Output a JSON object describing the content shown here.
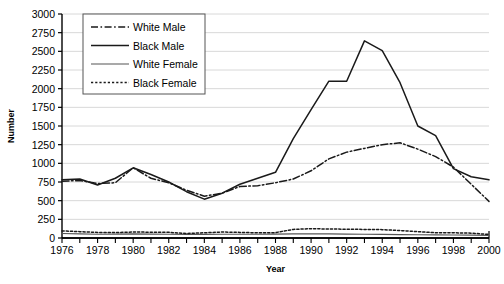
{
  "chart_data": {
    "type": "line",
    "title": "",
    "xlabel": "Year",
    "ylabel": "Number",
    "xlim": [
      1976,
      2000
    ],
    "ylim": [
      0,
      3000
    ],
    "ytick_step": 250,
    "xtick_step": 1,
    "xlabel_step": 2,
    "grid": "horizontal",
    "legend_position": "top-left-inside",
    "x": [
      1976,
      1977,
      1978,
      1979,
      1980,
      1981,
      1982,
      1983,
      1984,
      1985,
      1986,
      1987,
      1988,
      1989,
      1990,
      1991,
      1992,
      1993,
      1994,
      1995,
      1996,
      1997,
      1998,
      1999,
      2000
    ],
    "xticklabels": [
      "1976",
      "",
      "1978",
      "",
      "1980",
      "",
      "1982",
      "",
      "1984",
      "",
      "1986",
      "",
      "1988",
      "",
      "1990",
      "",
      "1992",
      "",
      "1994",
      "",
      "1996",
      "",
      "1998",
      "",
      "2000"
    ],
    "yticklabels": [
      "0",
      "250",
      "500",
      "750",
      "1000",
      "1250",
      "1500",
      "1750",
      "2000",
      "2250",
      "2500",
      "2750",
      "3000"
    ],
    "series": [
      {
        "name": "White Male",
        "linestyle": "dashdot",
        "color": "#1a1a1a",
        "values": [
          760,
          770,
          730,
          740,
          940,
          800,
          740,
          640,
          560,
          600,
          690,
          700,
          740,
          790,
          900,
          1060,
          1150,
          1200,
          1250,
          1275,
          1190,
          1090,
          950,
          720,
          490
        ]
      },
      {
        "name": "Black Male",
        "linestyle": "solid",
        "color": "#1a1a1a",
        "values": [
          780,
          790,
          710,
          800,
          940,
          850,
          750,
          620,
          520,
          600,
          720,
          800,
          880,
          1330,
          1720,
          2100,
          2100,
          2640,
          2510,
          2080,
          1500,
          1370,
          930,
          820,
          780
        ]
      },
      {
        "name": "White Female",
        "linestyle": "solid",
        "color": "#555555",
        "values": [
          60,
          55,
          50,
          52,
          55,
          52,
          50,
          48,
          48,
          50,
          50,
          50,
          52,
          55,
          55,
          55,
          52,
          50,
          48,
          45,
          44,
          42,
          40,
          38,
          35
        ]
      },
      {
        "name": "Black Female",
        "linestyle": "dotted",
        "color": "#1a1a1a",
        "values": [
          95,
          85,
          75,
          72,
          80,
          78,
          76,
          60,
          70,
          80,
          75,
          70,
          72,
          115,
          125,
          120,
          118,
          115,
          112,
          100,
          85,
          70,
          70,
          65,
          48
        ]
      }
    ]
  },
  "legend": {
    "entries": [
      {
        "label": "White Male"
      },
      {
        "label": "Black Male"
      },
      {
        "label": "White Female"
      },
      {
        "label": "Black Female"
      }
    ]
  },
  "axes": {
    "y_title": "Number",
    "x_title": "Year"
  }
}
